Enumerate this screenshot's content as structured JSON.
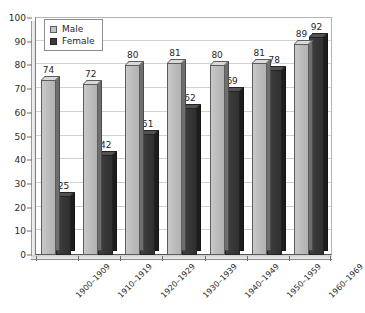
{
  "chart_data": {
    "type": "bar",
    "title": "",
    "subtitle": "",
    "xlabel": "",
    "ylabel": "",
    "ylim": [
      0,
      100
    ],
    "ytick_step": 10,
    "yticks": [
      0,
      10,
      20,
      30,
      40,
      50,
      60,
      70,
      80,
      90,
      100
    ],
    "grid": true,
    "legend_position": "top-left",
    "categories": [
      "1900–1909",
      "1910–1919",
      "1920–1929",
      "1930–1939",
      "1940–1949",
      "1950–1959",
      "1960–1969"
    ],
    "series": [
      {
        "name": "Male",
        "color": "#bdbdbd",
        "values": [
          74,
          72,
          80,
          81,
          80,
          81,
          89
        ]
      },
      {
        "name": "Female",
        "color": "#383838",
        "values": [
          25,
          42,
          51,
          62,
          69,
          78,
          92
        ]
      }
    ]
  },
  "legend": {
    "items": [
      {
        "label": "Male",
        "swatch": "male-swatch-icon"
      },
      {
        "label": "Female",
        "swatch": "female-swatch-icon"
      }
    ]
  },
  "axes": {
    "y": {
      "labels": [
        "100",
        "90",
        "80",
        "70",
        "60",
        "50",
        "40",
        "30",
        "20",
        "10",
        "0"
      ]
    },
    "x": {
      "labels": [
        "1900–1909",
        "1910–1919",
        "1920–1929",
        "1930–1939",
        "1940–1949",
        "1950–1959",
        "1960–1969"
      ]
    }
  },
  "value_labels": {
    "male": [
      "74",
      "72",
      "80",
      "81",
      "80",
      "81",
      "89"
    ],
    "female": [
      "25",
      "42",
      "51",
      "62",
      "69",
      "78",
      "92"
    ]
  }
}
